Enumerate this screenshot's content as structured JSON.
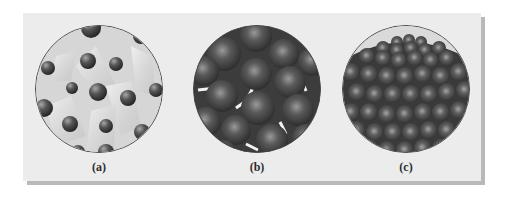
{
  "figure": {
    "panels": [
      {
        "id": "a",
        "label": "(a)",
        "state": "gas",
        "description": "Widely spaced spheres with motion trails"
      },
      {
        "id": "b",
        "label": "(b)",
        "state": "liquid",
        "description": "Closely packed, disordered spheres"
      },
      {
        "id": "c",
        "label": "(c)",
        "state": "solid",
        "description": "Closely packed, ordered lattice of spheres"
      }
    ]
  },
  "colors": {
    "panel_background": "#ececec",
    "panel_shadow": "#b9b9b9",
    "sphere_dark": "#3a3a3a",
    "sphere_highlight": "#9a9a9a",
    "gas_background": "#d8d8d8"
  }
}
